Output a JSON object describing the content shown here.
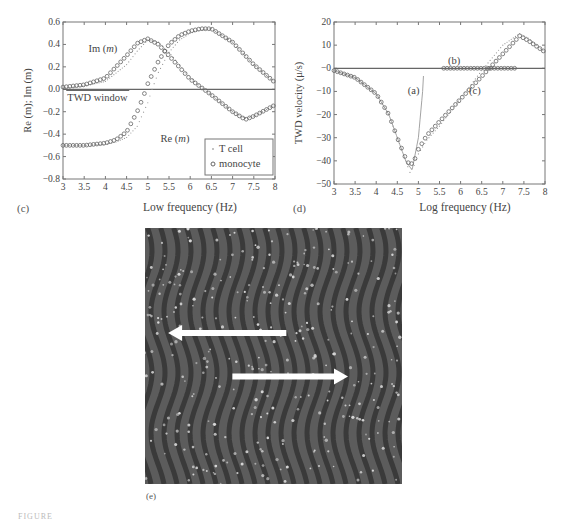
{
  "figure": {
    "panels": [
      "(c)",
      "(d)",
      "(e)"
    ],
    "caption_fragment": "FIGURE"
  },
  "chart_data": [
    {
      "id": "c",
      "type": "line",
      "panel_label": "(c)",
      "xlabel": "Low frequency (Hz)",
      "ylabel": "Re (m); Im (m)",
      "xlim": [
        3,
        8
      ],
      "ylim": [
        -0.8,
        0.6
      ],
      "xticks": [
        "3",
        "3.5",
        "4",
        "4.5",
        "5",
        "5.5",
        "6",
        "6.5",
        "7",
        "7.5",
        "8"
      ],
      "yticks": [
        "0.6",
        "0.4",
        "0.2",
        "0.0",
        "-0.2",
        "-0.4",
        "-0.6",
        "-0.8"
      ],
      "legend": [
        {
          "label": "T cell",
          "marker": "dot"
        },
        {
          "label": "monocyte",
          "marker": "circle"
        }
      ],
      "legend_position": "lower right",
      "annotations": [
        {
          "text": "Im (m)",
          "x": 3.6,
          "y": 0.33
        },
        {
          "text": "Re (m)",
          "x": 5.3,
          "y": -0.47
        },
        {
          "text": "TWD window",
          "x": 3.1,
          "y": -0.1
        }
      ],
      "hline": 0.0,
      "series": [
        {
          "name": "T cell Re(m)",
          "marker": "dot",
          "x": [
            3,
            3.5,
            4,
            4.25,
            4.5,
            4.75,
            5,
            5.1,
            5.25,
            5.5,
            5.75,
            6,
            6.25,
            6.5,
            7,
            7.5,
            8
          ],
          "values": [
            -0.5,
            -0.5,
            -0.49,
            -0.47,
            -0.43,
            -0.33,
            -0.12,
            0.0,
            0.15,
            0.33,
            0.44,
            0.5,
            0.53,
            0.54,
            0.42,
            0.22,
            0.06
          ]
        },
        {
          "name": "T cell Im(m)",
          "marker": "dot",
          "x": [
            3,
            3.5,
            4,
            4.5,
            4.75,
            5,
            5.25,
            5.5,
            6,
            6.5,
            7,
            7.3,
            7.5,
            8
          ],
          "values": [
            0.01,
            0.03,
            0.07,
            0.22,
            0.34,
            0.44,
            0.42,
            0.33,
            0.1,
            -0.05,
            -0.2,
            -0.26,
            -0.24,
            -0.14
          ]
        },
        {
          "name": "monocyte Re(m)",
          "marker": "circle",
          "x": [
            3,
            3.5,
            4,
            4.25,
            4.5,
            4.75,
            4.9,
            5,
            5.25,
            5.5,
            5.75,
            6,
            6.25,
            6.5,
            7,
            7.5,
            8
          ],
          "values": [
            -0.5,
            -0.5,
            -0.48,
            -0.45,
            -0.38,
            -0.2,
            -0.06,
            0.05,
            0.25,
            0.4,
            0.48,
            0.52,
            0.54,
            0.54,
            0.42,
            0.22,
            0.06
          ]
        },
        {
          "name": "monocyte Im(m)",
          "marker": "circle",
          "x": [
            3,
            3.5,
            4,
            4.5,
            4.75,
            5,
            5.25,
            5.5,
            6,
            6.5,
            7,
            7.3,
            7.5,
            8
          ],
          "values": [
            0.02,
            0.04,
            0.1,
            0.3,
            0.41,
            0.45,
            0.4,
            0.3,
            0.09,
            -0.05,
            -0.2,
            -0.27,
            -0.24,
            -0.14
          ]
        }
      ]
    },
    {
      "id": "d",
      "type": "line",
      "panel_label": "(d)",
      "xlabel": "Log frequency (Hz)",
      "ylabel": "TWD velocity (μ/s)",
      "xlim": [
        3,
        8
      ],
      "ylim": [
        -50,
        20
      ],
      "xticks": [
        "3",
        "3.5",
        "4",
        "4.5",
        "5",
        "5.5",
        "6",
        "6.5",
        "7",
        "7.5",
        "8"
      ],
      "yticks": [
        "20",
        "10",
        "-0",
        "-10",
        "-20",
        "-30",
        "-40",
        "-50"
      ],
      "hline": 0,
      "annotations": [
        {
          "text": "(a)",
          "x": 4.75,
          "y": -11
        },
        {
          "text": "(b)",
          "x": 5.7,
          "y": 2
        },
        {
          "text": "(c)",
          "x": 6.2,
          "y": -11
        }
      ],
      "series": [
        {
          "name": "(a)",
          "marker": "line",
          "x": [
            3,
            3.5,
            4,
            4.3,
            4.5,
            4.7,
            4.85,
            5.0,
            5.1,
            5.13
          ],
          "values": [
            -1,
            -4,
            -11,
            -20,
            -30,
            -40,
            -44,
            -30,
            -10,
            0
          ]
        },
        {
          "name": "(b)",
          "marker": "circle",
          "x": [
            5.6,
            6.0,
            6.5,
            7.0,
            7.3
          ],
          "values": [
            0,
            0,
            0,
            0,
            0
          ]
        },
        {
          "name": "(c)",
          "marker": "dot",
          "x": [
            3,
            3.5,
            4,
            4.3,
            4.5,
            4.7,
            4.8,
            4.9,
            5.0,
            5.2,
            5.5,
            6.0,
            6.5,
            7.0,
            7.4,
            7.6,
            8.0
          ],
          "values": [
            -1,
            -4,
            -11,
            -20,
            -30,
            -40,
            -45,
            -42,
            -37,
            -31,
            -25,
            -13,
            -1,
            10,
            15,
            13,
            7
          ]
        },
        {
          "name": "(c) monocyte",
          "marker": "circle",
          "x": [
            3,
            3.5,
            4,
            4.3,
            4.5,
            4.7,
            4.8,
            4.9,
            5.0,
            5.2,
            5.5,
            7.4,
            7.6,
            8.0
          ],
          "values": [
            -1,
            -4,
            -11,
            -20,
            -30,
            -39,
            -42,
            -40,
            -35,
            -29,
            -23,
            14,
            12,
            7
          ]
        }
      ]
    }
  ],
  "image_e": {
    "panel_label": "(e)",
    "description": "Micrograph of wavy electrode array with cells",
    "arrows": [
      {
        "direction": "left",
        "from_x": 0.55,
        "to_x": 0.09,
        "y": 0.41
      },
      {
        "direction": "right",
        "from_x": 0.34,
        "to_x": 0.79,
        "y": 0.58
      }
    ]
  }
}
